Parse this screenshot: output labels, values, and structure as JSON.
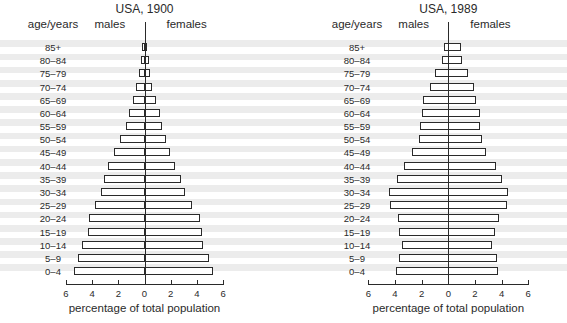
{
  "chart_data": [
    {
      "type": "bar",
      "orientation": "horizontal",
      "subtype": "population-pyramid",
      "title": "USA, 1900",
      "ylabel": "age/years",
      "xlabel": "percentage of total population",
      "left_label": "males",
      "right_label": "females",
      "xlim": [
        -6,
        6
      ],
      "xticks": [
        "6",
        "4",
        "2",
        "0",
        "2",
        "4",
        "6"
      ],
      "grid": false,
      "categories": [
        "85+",
        "80–84",
        "75–79",
        "70–74",
        "65–69",
        "60–64",
        "55–59",
        "50–54",
        "45–49",
        "40–44",
        "35–39",
        "30–34",
        "25–29",
        "20–24",
        "15–19",
        "10–14",
        "5–9",
        "0–4"
      ],
      "series": [
        {
          "name": "males",
          "values": [
            0.2,
            0.3,
            0.45,
            0.65,
            0.9,
            1.2,
            1.4,
            1.9,
            2.3,
            2.75,
            3.1,
            3.3,
            3.8,
            4.2,
            4.3,
            4.75,
            5.1,
            5.4
          ]
        },
        {
          "name": "females",
          "values": [
            0.2,
            0.35,
            0.45,
            0.6,
            0.85,
            1.15,
            1.3,
            1.65,
            1.95,
            2.3,
            2.75,
            3.1,
            3.65,
            4.2,
            4.4,
            4.5,
            4.9,
            5.2
          ]
        }
      ]
    },
    {
      "type": "bar",
      "orientation": "horizontal",
      "subtype": "population-pyramid",
      "title": "USA, 1989",
      "ylabel": "age/years",
      "xlabel": "percentage of total population",
      "left_label": "males",
      "right_label": "females",
      "xlim": [
        -6,
        6
      ],
      "xticks": [
        "6",
        "4",
        "2",
        "0",
        "2",
        "4",
        "6"
      ],
      "grid": false,
      "categories": [
        "85+",
        "80–84",
        "75–79",
        "70–74",
        "65–69",
        "60–64",
        "55–59",
        "50–54",
        "45–49",
        "40–44",
        "35–39",
        "30–34",
        "25–29",
        "20–24",
        "15–19",
        "10–14",
        "5–9",
        "0–4"
      ],
      "series": [
        {
          "name": "males",
          "values": [
            0.3,
            0.5,
            1.0,
            1.35,
            1.9,
            2.0,
            2.1,
            2.2,
            2.7,
            3.3,
            3.85,
            4.45,
            4.35,
            3.8,
            3.7,
            3.5,
            3.7,
            3.9
          ]
        },
        {
          "name": "females",
          "values": [
            0.95,
            1.05,
            1.5,
            1.9,
            2.1,
            2.35,
            2.35,
            2.5,
            2.85,
            3.55,
            4.0,
            4.5,
            4.4,
            3.8,
            3.5,
            3.3,
            3.65,
            3.75
          ]
        }
      ]
    }
  ]
}
